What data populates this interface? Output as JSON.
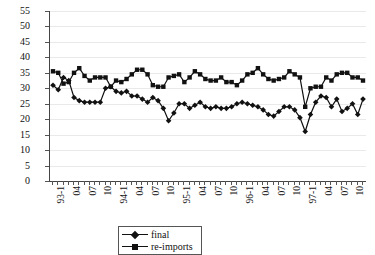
{
  "chart_data": {
    "type": "line",
    "title": "",
    "xlabel": "",
    "ylabel": "",
    "ylim": [
      0,
      55
    ],
    "ytick_step": 5,
    "yticks": [
      0,
      5,
      10,
      15,
      20,
      25,
      30,
      35,
      40,
      45,
      50,
      55
    ],
    "grid": true,
    "legend_position": "bottom-center",
    "x_tick_labels_every": 3,
    "x": [
      "93-1",
      "93-2",
      "93-3",
      "04",
      "93-5",
      "93-6",
      "07",
      "93-8",
      "93-9",
      "10",
      "93-11",
      "93-12",
      "94-1",
      "94-2",
      "94-3",
      "04",
      "94-5",
      "94-6",
      "07",
      "94-8",
      "94-9",
      "10",
      "94-11",
      "94-12",
      "95-1",
      "95-2",
      "95-3",
      "04",
      "95-5",
      "95-6",
      "07",
      "95-8",
      "95-9",
      "10",
      "95-11",
      "95-12",
      "96-1",
      "96-2",
      "96-3",
      "04",
      "96-5",
      "96-6",
      "07",
      "96-8",
      "96-9",
      "10",
      "96-11",
      "96-12",
      "97-1",
      "97-2",
      "97-3",
      "04",
      "97-5",
      "97-6",
      "07",
      "97-8",
      "97-9",
      "10",
      "97-11",
      "97-12"
    ],
    "x_tick_labels": [
      {
        "index": 0,
        "label": "93-1"
      },
      {
        "index": 3,
        "label": "04"
      },
      {
        "index": 6,
        "label": "07"
      },
      {
        "index": 9,
        "label": "10"
      },
      {
        "index": 12,
        "label": "94-1"
      },
      {
        "index": 15,
        "label": "04"
      },
      {
        "index": 18,
        "label": "07"
      },
      {
        "index": 21,
        "label": "10"
      },
      {
        "index": 24,
        "label": "95-1"
      },
      {
        "index": 27,
        "label": "04"
      },
      {
        "index": 30,
        "label": "07"
      },
      {
        "index": 33,
        "label": "10"
      },
      {
        "index": 36,
        "label": "96-1"
      },
      {
        "index": 39,
        "label": "04"
      },
      {
        "index": 42,
        "label": "07"
      },
      {
        "index": 45,
        "label": "10"
      },
      {
        "index": 48,
        "label": "97-1"
      },
      {
        "index": 51,
        "label": "04"
      },
      {
        "index": 54,
        "label": "07"
      },
      {
        "index": 57,
        "label": "10"
      }
    ],
    "series": [
      {
        "name": "final",
        "marker": "diamond",
        "color": "#111111",
        "values": [
          31.0,
          29.5,
          33.5,
          32.5,
          27.0,
          26.0,
          25.5,
          25.5,
          25.5,
          25.5,
          30.0,
          30.5,
          29.0,
          28.5,
          29.0,
          27.5,
          27.5,
          26.5,
          25.5,
          27.0,
          26.0,
          23.5,
          19.5,
          22.0,
          25.0,
          25.0,
          23.5,
          24.5,
          25.5,
          24.0,
          23.5,
          24.0,
          23.5,
          23.5,
          24.0,
          25.0,
          25.5,
          25.0,
          24.5,
          24.0,
          23.0,
          21.5,
          21.0,
          22.5,
          24.0,
          24.0,
          23.0,
          20.5,
          16.0,
          21.5,
          25.5,
          27.5,
          27.0,
          24.0,
          26.5,
          22.5,
          23.5,
          25.0,
          21.5,
          26.5
        ]
      },
      {
        "name": "re-imports",
        "marker": "square",
        "color": "#111111",
        "values": [
          35.5,
          35.0,
          31.5,
          32.0,
          35.0,
          36.5,
          34.0,
          32.5,
          33.5,
          33.5,
          33.5,
          30.5,
          32.5,
          32.0,
          33.0,
          34.5,
          36.0,
          36.0,
          34.5,
          31.0,
          30.5,
          30.5,
          33.5,
          34.0,
          34.5,
          32.0,
          33.5,
          35.5,
          34.5,
          33.0,
          32.5,
          32.5,
          33.5,
          32.0,
          32.0,
          31.0,
          32.5,
          34.5,
          35.0,
          36.5,
          34.5,
          33.0,
          32.5,
          33.0,
          33.5,
          35.5,
          34.5,
          33.5,
          24.0,
          30.0,
          30.5,
          30.5,
          33.5,
          32.5,
          34.5,
          35.0,
          35.0,
          33.5,
          33.5,
          32.5
        ]
      }
    ]
  },
  "legend": {
    "items": [
      {
        "label": "final",
        "marker": "diamond"
      },
      {
        "label": "re-imports",
        "marker": "square"
      }
    ]
  }
}
